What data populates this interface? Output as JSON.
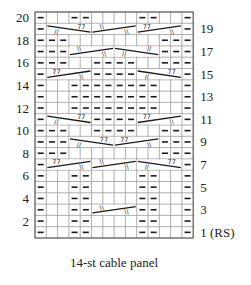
{
  "chart_title": "14-st cable panel",
  "stitches": 14,
  "rows": 20,
  "rs_label": "(RS)",
  "colors": {
    "grid": "#9a9a9a",
    "border": "#555555",
    "ink": "#1a1a1a",
    "background": "#ffffff"
  },
  "left_labels": [
    2,
    4,
    6,
    8,
    10,
    12,
    14,
    16,
    18,
    20
  ],
  "right_labels": [
    1,
    3,
    5,
    7,
    9,
    11,
    13,
    15,
    17,
    19
  ],
  "legend_symbols": {
    "P": "purl",
    ".": "knit",
    "cable_up": "cable line rising left-to-right",
    "cable_down": "cable line falling left-to-right"
  },
  "grid": {
    "20": "P..PP....PP..P",
    "19": "P............P",
    "18": "PPP........PPP",
    "17": "PPP........PPP",
    "16": "PPP..PPPP..PPP",
    "15": "P....PPPP....P",
    "14": "P..PPPPPPPP..P",
    "13": "P..PPPPPPPP..P",
    "12": "P..PPPPPPPP..P",
    "11": "P....PPPP....P",
    "10": "PPP..PPPP..PPP",
    "9": "PPP........PPP",
    "8": "PPP........PPP",
    "7": "P............P",
    "6": "P..PP....PP..P",
    "5": "P..PP....PP..P",
    "4": "P..PP....PP..P",
    "3": "P..PP....PP..P",
    "2": "P..PP....PP..P",
    "1": "P..PP....PP..P"
  },
  "cables": [
    {
      "row": 19,
      "start": 2,
      "width": 4,
      "dir": "down",
      "left_mark": "//",
      "right_mark": "77"
    },
    {
      "row": 19,
      "start": 6,
      "width": 4,
      "dir": "up",
      "left_mark": "\\\\",
      "right_mark": "\\\\"
    },
    {
      "row": 19,
      "start": 10,
      "width": 4,
      "dir": "up",
      "left_mark": "77",
      "right_mark": "\\\\"
    },
    {
      "row": 17,
      "start": 4,
      "width": 4,
      "dir": "up",
      "left_mark": "\\\\",
      "right_mark": "\\\\"
    },
    {
      "row": 17,
      "start": 8,
      "width": 4,
      "dir": "down",
      "left_mark": "//",
      "right_mark": "//"
    },
    {
      "row": 15,
      "start": 2,
      "width": 4,
      "dir": "up",
      "left_mark": "77",
      "right_mark": "\\\\"
    },
    {
      "row": 15,
      "start": 10,
      "width": 4,
      "dir": "down",
      "left_mark": "//",
      "right_mark": "77"
    },
    {
      "row": 11,
      "start": 2,
      "width": 4,
      "dir": "down",
      "left_mark": "//",
      "right_mark": "77"
    },
    {
      "row": 11,
      "start": 10,
      "width": 4,
      "dir": "up",
      "left_mark": "77",
      "right_mark": "\\\\"
    },
    {
      "row": 9,
      "start": 4,
      "width": 4,
      "dir": "down",
      "left_mark": "//",
      "right_mark": "77"
    },
    {
      "row": 9,
      "start": 8,
      "width": 4,
      "dir": "up",
      "left_mark": "77",
      "right_mark": "\\\\"
    },
    {
      "row": 7,
      "start": 2,
      "width": 4,
      "dir": "up",
      "left_mark": "77",
      "right_mark": "\\\\"
    },
    {
      "row": 7,
      "start": 6,
      "width": 4,
      "dir": "up",
      "left_mark": "\\\\",
      "right_mark": "\\\\"
    },
    {
      "row": 7,
      "start": 10,
      "width": 4,
      "dir": "down",
      "left_mark": "//",
      "right_mark": "77"
    },
    {
      "row": 3,
      "start": 6,
      "width": 4,
      "dir": "up",
      "left_mark": "\\\\",
      "right_mark": "\\\\"
    }
  ]
}
